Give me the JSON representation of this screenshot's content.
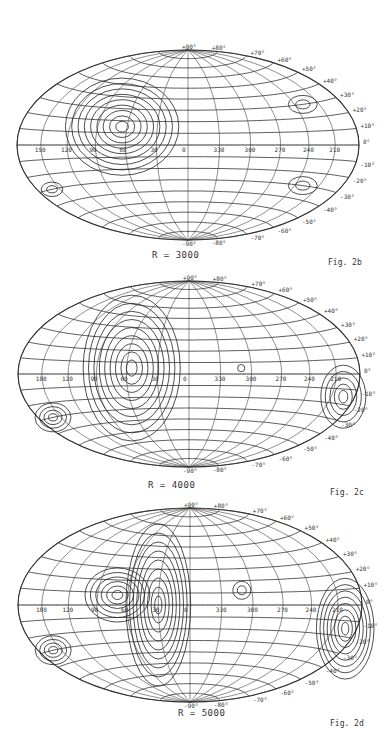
{
  "figures": [
    {
      "id": "fig-2b",
      "radius_label": "R = 3000",
      "figure_label": "Fig. 2b",
      "top": 40
    },
    {
      "id": "fig-2c",
      "radius_label": "R = 4000",
      "figure_label": "Fig. 2c",
      "top": 270
    },
    {
      "id": "fig-2d",
      "radius_label": "R = 5000",
      "figure_label": "Fig. 2d",
      "top": 500
    }
  ],
  "axes": {
    "latitude_top": [
      "+90°",
      "+80°",
      "+70°",
      "+60°",
      "+50°",
      "+40°",
      "+30°",
      "+20°",
      "+10°",
      "0°"
    ],
    "latitude_bottom": [
      "-10°",
      "-20°",
      "-30°",
      "-40°",
      "-50°",
      "-60°",
      "-70°",
      "-80°",
      "-90°"
    ],
    "longitude_fig2b": [
      "150",
      "120",
      "90",
      "60",
      "30",
      "0",
      "330",
      "300",
      "270",
      "240",
      "210"
    ],
    "longitude_fig2c": [
      "180",
      "120",
      "90",
      "60",
      "30",
      "0",
      "330",
      "300",
      "270",
      "240",
      "210"
    ],
    "longitude_fig2d": [
      "180",
      "120",
      "90",
      "60",
      "30",
      "0",
      "330",
      "300",
      "270",
      "240",
      "210"
    ]
  },
  "chart_data": [
    {
      "type": "heatmap",
      "title": "R = 3000",
      "caption": "Fig. 2b",
      "projection": "Aitoff equal-area (galactic coordinates)",
      "x_ticks": [
        "150",
        "120",
        "90",
        "60",
        "30",
        "0",
        "330",
        "300",
        "270",
        "240",
        "210"
      ],
      "y_ticks": [
        "+90°",
        "+80°",
        "+70°",
        "+60°",
        "+50°",
        "+40°",
        "+30°",
        "+20°",
        "+10°",
        "0°",
        "-10°",
        "-20°",
        "-30°",
        "-40°",
        "-50°",
        "-60°",
        "-70°",
        "-80°",
        "-90°"
      ],
      "features": "Strong concentric contour maximum near l≈300°, b≈+15°; secondary contour ridges near l≈150-120° both hemispheres; small closed contour near l≈220°, b≈-30°"
    },
    {
      "type": "heatmap",
      "title": "R = 4000",
      "caption": "Fig. 2c",
      "projection": "Aitoff equal-area (galactic coordinates)",
      "x_ticks": [
        "180",
        "120",
        "90",
        "60",
        "30",
        "0",
        "330",
        "300",
        "270",
        "240",
        "210"
      ],
      "y_ticks": [
        "+90°",
        "+80°",
        "+70°",
        "+60°",
        "+50°",
        "+40°",
        "+30°",
        "+20°",
        "+10°",
        "0°",
        "-10°",
        "-20°",
        "-30°",
        "-40°",
        "-50°",
        "-60°",
        "-70°",
        "-80°",
        "-90°"
      ],
      "features": "Elongated contour maximum from l≈330°,b≈-30° to l≈300°,b≈+10°; small closed contour near l≈45°, b≈+5°; ridges near l≈150° and l≈220°, b≈-30°"
    },
    {
      "type": "heatmap",
      "title": "R = 5000",
      "caption": "Fig. 2d",
      "projection": "Aitoff equal-area (galactic coordinates)",
      "x_ticks": [
        "180",
        "120",
        "90",
        "60",
        "30",
        "0",
        "330",
        "300",
        "270",
        "240",
        "210"
      ],
      "y_ticks": [
        "+90°",
        "+80°",
        "+70°",
        "+60°",
        "+50°",
        "+40°",
        "+30°",
        "+20°",
        "+10°",
        "0°",
        "-10°",
        "-20°",
        "-30°",
        "-40°",
        "-50°",
        "-60°",
        "-70°",
        "-80°",
        "-90°"
      ],
      "features": "Dense contours along l≈330° band from b≈-30° to +30°; closed maxima near l≈300°,b≈+5° and l≈45°,b≈+10°; dense contours near l≈150°-180° southern; closed contour near l≈220°,b≈-30°"
    }
  ]
}
